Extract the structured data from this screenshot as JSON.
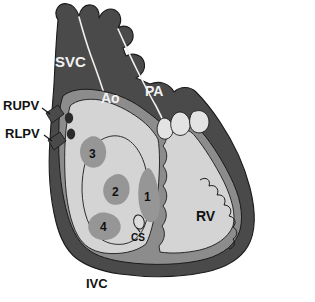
{
  "figure": {
    "type": "anatomical-diagram"
  },
  "colors": {
    "vessel_dark": "#4a4a4a",
    "myocardium_outer": "#4a4a4a",
    "myocardium_mid": "#8c8c8c",
    "chamber_light": "#d4d4d4",
    "blob_gray": "#969696",
    "ostium_dark": "#2b2b2b",
    "outline": "#1a1a1a",
    "label_light": "#f2f2f2",
    "label_dark": "#111111",
    "background": "#ffffff"
  },
  "labels": {
    "svc": "SVC",
    "ao": "Ao",
    "pa": "PA",
    "rv": "RV",
    "ivc": "IVC",
    "cs": "CS",
    "rupv": "RUPV",
    "rlpv": "RLPV"
  },
  "markers": [
    {
      "id": "1",
      "label": "1",
      "x": 146,
      "y": 196
    },
    {
      "id": "2",
      "label": "2",
      "x": 116,
      "y": 190
    },
    {
      "id": "3",
      "label": "3",
      "x": 93,
      "y": 152
    },
    {
      "id": "4",
      "label": "4",
      "x": 104,
      "y": 224
    }
  ],
  "structures": {
    "svc_name": "superior-vena-cava",
    "ao_name": "aorta",
    "pa_name": "pulmonary-artery",
    "rv_name": "right-ventricle",
    "ivc_name": "inferior-vena-cava",
    "cs_name": "coronary-sinus",
    "rupv_name": "right-upper-pulmonary-vein",
    "rlpv_name": "right-lower-pulmonary-vein",
    "pulmonary_valve_name": "pulmonary-valve-leaflets"
  }
}
